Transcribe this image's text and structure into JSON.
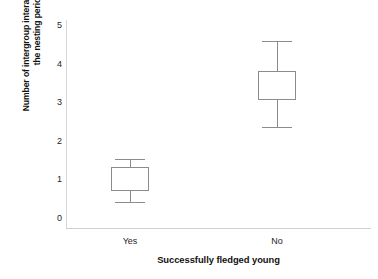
{
  "chart_data": {
    "type": "box",
    "title": "",
    "xlabel": "Successfully fledged young",
    "ylabel_line1": "Number of intergroup interactions during",
    "ylabel_line2": "the nesting period",
    "categories": [
      "Yes",
      "No"
    ],
    "ylim": [
      0,
      5
    ],
    "yticks": [
      "0",
      "1",
      "2",
      "3",
      "4",
      "5"
    ],
    "grid": false,
    "legend": "none",
    "axis_color": "#d0d0d0",
    "box_color": "#8c8c8c",
    "box_fill": "#ffffff",
    "boxes": [
      {
        "category": "Yes",
        "whisker_low": 0.41,
        "q1": 0.7,
        "median": 0.7,
        "q3": 1.32,
        "whisker_high": 1.53
      },
      {
        "category": "No",
        "whisker_low": 2.36,
        "q1": 3.06,
        "median": 3.06,
        "q3": 3.81,
        "whisker_high": 4.59
      }
    ]
  },
  "yticks": {
    "t0": "0",
    "t1": "1",
    "t2": "2",
    "t3": "3",
    "t4": "4",
    "t5": "5"
  },
  "xticks": {
    "yes": "Yes",
    "no": "No"
  },
  "labels": {
    "x_axis_title": "Successfully fledged young",
    "y_axis_title_line1": "Number of intergroup interactions during",
    "y_axis_title_line2": "the nesting period"
  }
}
